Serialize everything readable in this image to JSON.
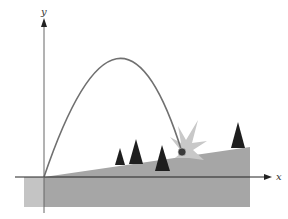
{
  "figure": {
    "type": "projectile-on-incline diagram",
    "axes": {
      "x_label": "x",
      "y_label": "y"
    },
    "colors": {
      "ground": "#a6a6a6",
      "ground_left": "#c4c4c4",
      "trajectory": "#707070",
      "starburst": "#c8c8c8",
      "trees": "#1e1e1e",
      "axes": "#222222",
      "ball": "#3a3a3a"
    },
    "elements": [
      {
        "name": "trajectory",
        "description": "parabolic path from origin to impact point on incline"
      },
      {
        "name": "incline",
        "description": "sloped ground rising to the right"
      },
      {
        "name": "ball",
        "description": "projectile at impact point"
      },
      {
        "name": "impact-burst",
        "description": "starburst at impact"
      },
      {
        "name": "trees",
        "count": 4
      }
    ]
  }
}
